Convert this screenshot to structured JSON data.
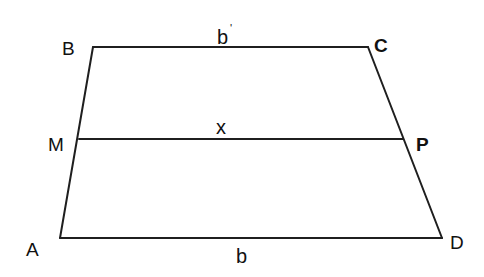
{
  "diagram": {
    "type": "trapezoid",
    "vertices": {
      "A": {
        "label": "A",
        "x": 60,
        "y": 238,
        "label_x": 26,
        "label_y": 256,
        "bold": false
      },
      "B": {
        "label": "B",
        "x": 93,
        "y": 47,
        "label_x": 62,
        "label_y": 55,
        "bold": false
      },
      "C": {
        "label": "C",
        "x": 368,
        "y": 47,
        "label_x": 374,
        "label_y": 52,
        "bold": true
      },
      "D": {
        "label": "D",
        "x": 442,
        "y": 238,
        "label_x": 450,
        "label_y": 249,
        "bold": false
      },
      "M": {
        "label": "M",
        "x": 79,
        "y": 139,
        "label_x": 48,
        "label_y": 151,
        "bold": false
      },
      "P": {
        "label": "P",
        "x": 403,
        "y": 139,
        "label_x": 416,
        "label_y": 151,
        "bold": true
      }
    },
    "segments": [
      {
        "name": "BC",
        "from": "B",
        "to": "C",
        "label": "b",
        "prime": "'",
        "label_x": 217,
        "label_y": 44
      },
      {
        "name": "MP",
        "from": "M",
        "to": "P",
        "label": "x",
        "prime": "",
        "label_x": 216,
        "label_y": 134
      },
      {
        "name": "AD",
        "from": "A",
        "to": "D",
        "label": "b",
        "prime": "",
        "label_x": 236,
        "label_y": 263
      },
      {
        "name": "AB",
        "from": "A",
        "to": "B",
        "label": "",
        "prime": ""
      },
      {
        "name": "CD",
        "from": "C",
        "to": "D",
        "label": "",
        "prime": ""
      }
    ],
    "stroke_color": "#1f1f1f",
    "background": "#ffffff"
  }
}
